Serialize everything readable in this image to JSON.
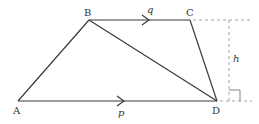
{
  "diagram": {
    "type": "trapezium",
    "vertices": {
      "A": {
        "label": "A",
        "x": 18,
        "y": 101
      },
      "B": {
        "label": "B",
        "x": 89,
        "y": 20
      },
      "C": {
        "label": "C",
        "x": 190,
        "y": 20
      },
      "D": {
        "label": "D",
        "x": 217,
        "y": 101
      }
    },
    "vectors": {
      "BC": {
        "label": "q"
      },
      "AD": {
        "label": "p"
      }
    },
    "height_label": "h",
    "colors": {
      "stroke": "#3a3a3a",
      "dashed": "#8a8a8a",
      "text": "#333333"
    }
  }
}
